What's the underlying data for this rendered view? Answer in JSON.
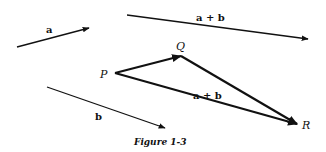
{
  "figure": {
    "caption": "Figure 1-3",
    "ink_color": "#111111",
    "background": "#ffffff",
    "free_vectors": [
      {
        "name": "a",
        "label": "a",
        "from": [
          17,
          47
        ],
        "to": [
          89,
          28
        ],
        "label_pos": [
          50,
          33
        ]
      },
      {
        "name": "a-plus-b",
        "label": "a + b",
        "from": [
          127,
          15
        ],
        "to": [
          308,
          39
        ],
        "label_pos": [
          215,
          21
        ]
      },
      {
        "name": "b",
        "label": "b",
        "from": [
          47,
          87
        ],
        "to": [
          165,
          128
        ],
        "label_pos": [
          98,
          119
        ]
      }
    ],
    "triangle": {
      "points": {
        "P": {
          "label": "P",
          "xy": [
            115,
            73
          ],
          "label_pos": [
            103,
            78
          ]
        },
        "Q": {
          "label": "Q",
          "xy": [
            181,
            56
          ],
          "label_pos": [
            177,
            50
          ]
        },
        "R": {
          "label": "R",
          "xy": [
            297,
            124
          ],
          "label_pos": [
            304,
            129
          ]
        }
      },
      "edges": [
        {
          "from": "P",
          "to": "Q",
          "label": ""
        },
        {
          "from": "Q",
          "to": "R",
          "label": ""
        },
        {
          "from": "P",
          "to": "R",
          "label": "a + b",
          "label_pos": [
            194,
            99
          ]
        }
      ]
    }
  }
}
